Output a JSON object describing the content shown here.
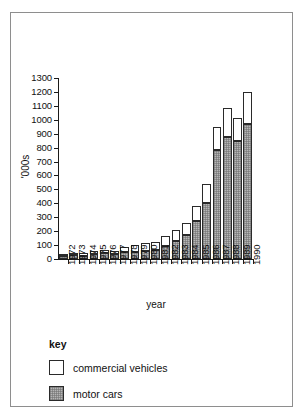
{
  "figure": {
    "y_axis_title": "'000s",
    "x_axis_title": "year"
  },
  "legend": {
    "title": "key",
    "items": [
      {
        "label": "commercial vehicles",
        "swatch": "white-square-icon",
        "color": "#ffffff"
      },
      {
        "label": "motor cars",
        "swatch": "gray-hatched-square-icon",
        "color": "#b6b6b6"
      }
    ]
  },
  "chart_data": {
    "type": "bar",
    "stacked": true,
    "title": "",
    "xlabel": "year",
    "ylabel": "'000s",
    "ylim": [
      0,
      1300
    ],
    "ytick_labels": [
      "0",
      "100",
      "200",
      "300",
      "400",
      "500",
      "600",
      "700",
      "800",
      "900",
      "1000",
      "1100",
      "1200",
      "1300"
    ],
    "yticks": [
      0,
      100,
      200,
      300,
      400,
      500,
      600,
      700,
      800,
      900,
      1000,
      1100,
      1200,
      1300
    ],
    "grid": false,
    "legend_position": "below-plot",
    "categories": [
      "1972",
      "1973",
      "1974",
      "1975",
      "1976",
      "1977",
      "1978",
      "1979",
      "1980",
      "1981",
      "1982",
      "1983",
      "1984",
      "1985",
      "1986",
      "1987",
      "1988",
      "1989",
      "1990"
    ],
    "series": [
      {
        "name": "motor cars",
        "color": "#b6b6b6",
        "values": [
          25,
          30,
          25,
          35,
          40,
          38,
          50,
          52,
          55,
          68,
          95,
          130,
          172,
          270,
          402,
          785,
          878,
          850,
          968
        ]
      },
      {
        "name": "commercial vehicles",
        "color": "#ffffff",
        "values": [
          10,
          12,
          18,
          22,
          22,
          22,
          35,
          48,
          62,
          55,
          70,
          75,
          88,
          108,
          140,
          165,
          207,
          160,
          232
        ]
      }
    ],
    "totals": [
      35,
      42,
      43,
      57,
      62,
      60,
      85,
      100,
      117,
      123,
      165,
      205,
      260,
      378,
      542,
      950,
      1085,
      1010,
      1200
    ]
  }
}
